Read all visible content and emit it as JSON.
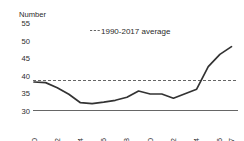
{
  "chart_data": {
    "type": "line",
    "title": "",
    "ylabel": "Number",
    "xlabel": "",
    "ylim": [
      30,
      55
    ],
    "yticks": [
      30,
      35,
      40,
      45,
      50,
      55
    ],
    "xlim": [
      2000,
      2017
    ],
    "xticks": [
      2000,
      2002,
      2004,
      2006,
      2008,
      2010,
      2012,
      2014,
      2016,
      2017
    ],
    "xtick_labels": [
      "2000",
      "2002",
      "2004",
      "2006",
      "2008",
      "2010",
      "2012",
      "2014",
      "2016",
      "2017"
    ],
    "grid": false,
    "legend_position": "top-center",
    "legend": [
      {
        "label": "1990-2017 average",
        "style": "dashed",
        "color": "#555555",
        "value": 40
      }
    ],
    "series": [
      {
        "name": "Number",
        "color": "#333333",
        "style": "solid",
        "x": [
          2000,
          2001,
          2002,
          2003,
          2004,
          2005,
          2006,
          2007,
          2008,
          2009,
          2010,
          2011,
          2012,
          2013,
          2014,
          2015,
          2016,
          2017
        ],
        "values": [
          39.5,
          39.3,
          37.6,
          35.4,
          32.6,
          32.3,
          32.8,
          33.4,
          34.4,
          36.5,
          35.5,
          35.5,
          34.1,
          35.6,
          37.1,
          44.6,
          48.7,
          51.3
        ]
      }
    ],
    "reference_lines": [
      {
        "name": "1990-2017 average",
        "value": 40,
        "style": "dashed",
        "color": "#555555"
      }
    ]
  },
  "axis": {
    "y_title": "Number",
    "y_tick_55": "55",
    "y_tick_50": "50",
    "y_tick_45": "45",
    "y_tick_40": "40",
    "y_tick_35": "35",
    "y_tick_30": "30"
  },
  "legend": {
    "average_label": "1990-2017 average"
  },
  "xlabels": {
    "t0": "2000",
    "t1": "2002",
    "t2": "2004",
    "t3": "2006",
    "t4": "2008",
    "t5": "2010",
    "t6": "2012",
    "t7": "2014",
    "t8": "2016",
    "t9": "2017"
  }
}
